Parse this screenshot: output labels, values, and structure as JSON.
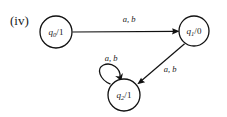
{
  "figure": {
    "label": "(iv)",
    "background": "#ffffff",
    "ink_color": "#111111"
  },
  "diagram": {
    "type": "state-transition-diagram",
    "states": [
      {
        "id": "q0",
        "name": "q",
        "subscript": "0",
        "output_separator": "/",
        "output": "1",
        "full_label": "q0/1",
        "cx": 56,
        "cy": 32,
        "r": 16
      },
      {
        "id": "q1",
        "name": "q",
        "subscript": "1",
        "output_separator": "/",
        "output": "0",
        "full_label": "q1/0",
        "cx": 194,
        "cy": 31,
        "r": 15
      },
      {
        "id": "q2",
        "name": "q",
        "subscript": "2",
        "output_separator": "/",
        "output": "1",
        "full_label": "q2/1",
        "cx": 124,
        "cy": 95,
        "r": 16
      }
    ],
    "transitions": [
      {
        "id": "t0",
        "from": "q0",
        "to": "q1",
        "label": "a, b",
        "shape": "straight-horizontal",
        "label_x": 129,
        "label_y": 22
      },
      {
        "id": "t1",
        "from": "q1",
        "to": "q2",
        "label": "a, b",
        "shape": "straight-diagonal",
        "label_x": 170,
        "label_y": 72
      },
      {
        "id": "t2",
        "from": "q2",
        "to": "q2",
        "label": "a, b",
        "shape": "self-loop",
        "label_x": 111,
        "label_y": 61
      }
    ]
  }
}
